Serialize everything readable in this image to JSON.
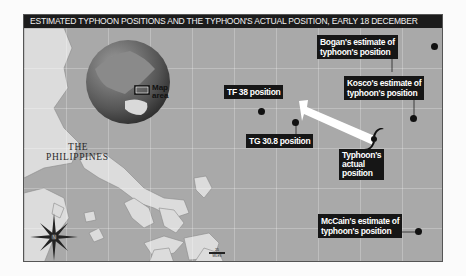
{
  "title": "ESTIMATED TYPHOON POSITIONS AND THE TYPHOON'S ACTUAL POSITION, EARLY 18 DECEMBER",
  "inset_globe": {
    "label_line1": "Map",
    "label_line2": "area"
  },
  "region_label": {
    "line1": "THE",
    "line2": "PHILIPPINES"
  },
  "markers": [
    {
      "id": "tf38",
      "label": "TF 38 position"
    },
    {
      "id": "tg308",
      "label": "TG 30.8 position"
    },
    {
      "id": "bogan",
      "line1": "Bogan's estimate of",
      "line2": "typhoon's position"
    },
    {
      "id": "kosco",
      "line1": "Kosco's estimate of",
      "line2": "typhoon's position"
    },
    {
      "id": "mccain",
      "line1": "McCain's estimate of",
      "line2": "typhoon's position"
    },
    {
      "id": "actual",
      "line1": "Typhoon's",
      "line2": "actual",
      "line3": "position"
    }
  ],
  "scale_bar": {
    "value": "25",
    "unit": "MILES"
  },
  "compass": {
    "letter": "N"
  },
  "colors": {
    "sea": "#a9a9a9",
    "land": "#dcdcdc",
    "labels_bg": "#161616",
    "arrow": "#ffffff",
    "title_bg": "#1c1c1c"
  }
}
